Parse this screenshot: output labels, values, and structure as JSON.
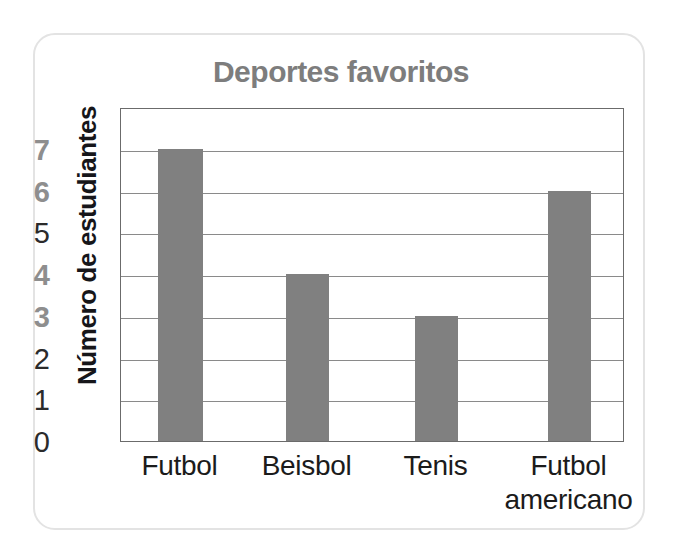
{
  "chart_data": {
    "type": "bar",
    "title": "Deportes favoritos",
    "xlabel": "",
    "ylabel": "Número de estudiantes",
    "categories": [
      "Futbol",
      "Beisbol",
      "Tenis",
      "Futbol americano"
    ],
    "values": [
      7,
      4,
      3,
      6
    ],
    "ylim": [
      0,
      8
    ],
    "ytick_labels": [
      "0",
      "1",
      "2",
      "3",
      "4",
      "5",
      "6",
      "7"
    ],
    "ytick_values": [
      0,
      1,
      2,
      3,
      4,
      5,
      6,
      7
    ],
    "grid": true,
    "legend": "none",
    "bar_color": "#808080",
    "title_color": "#7d7d7d",
    "axis_color": "#6b6b6b"
  },
  "card": {
    "border_color": "#e3e3e3"
  }
}
